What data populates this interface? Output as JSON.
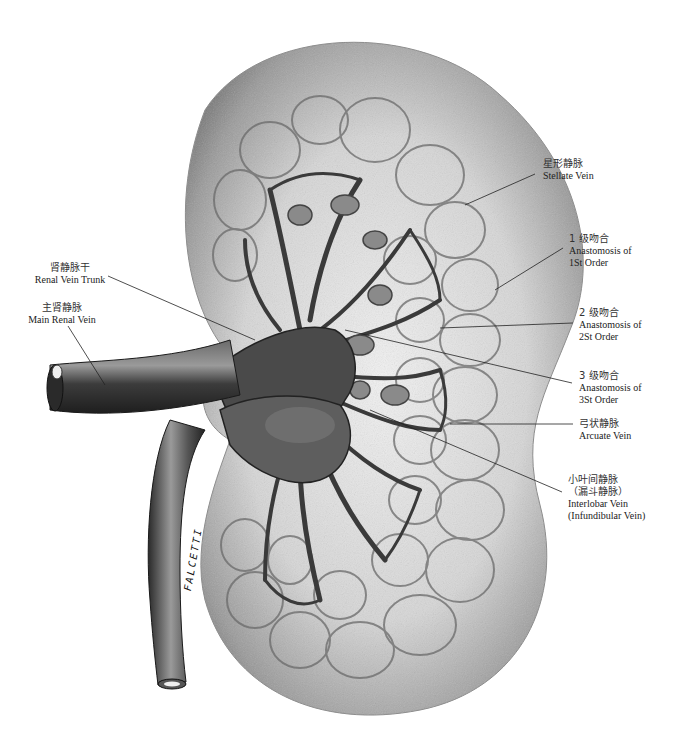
{
  "diagram": {
    "artist_signature": "FALCETTI",
    "labels": {
      "stellate_vein": {
        "zh": "星形静脉",
        "en": "Stellate Vein"
      },
      "anastomosis_1": {
        "zh": "1 级吻合",
        "en_line1": "Anastomosis of",
        "en_line2": "1St Order"
      },
      "anastomosis_2": {
        "zh": "2 级吻合",
        "en_line1": "Anastomosis of",
        "en_line2": "2St Order"
      },
      "anastomosis_3": {
        "zh": "3 级吻合",
        "en_line1": "Anastomosis of",
        "en_line2": "3St Order"
      },
      "arcuate_vein": {
        "zh": "弓状静脉",
        "en": "Arcuate Vein"
      },
      "interlobar_vein": {
        "zh_line1": "小叶间静脉",
        "zh_line2": "（漏斗静脉）",
        "en_line1": "Interlobar Vein",
        "en_line2": "(Infundibular Vein)"
      },
      "renal_vein_trunk": {
        "zh": "肾静脉干",
        "en": "Renal Vein Trunk"
      },
      "main_renal_vein": {
        "zh": "主肾静脉",
        "en": "Main Renal Vein"
      }
    },
    "colors": {
      "kidney_fill": "#c8c8c8",
      "kidney_edge": "#8a8a8a",
      "vein_dark": "#3a3a3a",
      "vein_mid": "#5a5a5a",
      "leader_line": "#222222"
    }
  }
}
